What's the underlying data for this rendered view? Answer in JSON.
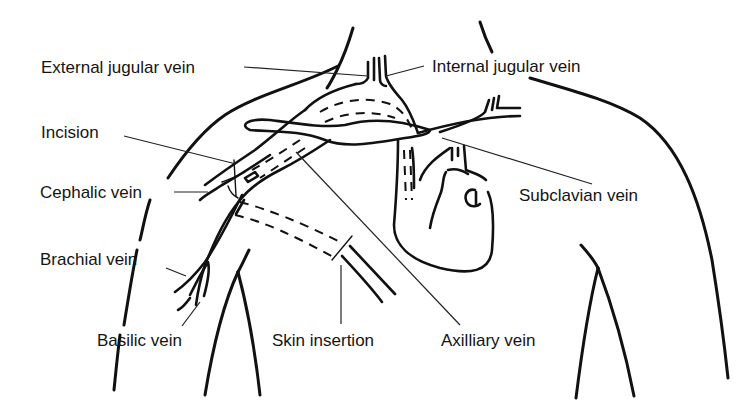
{
  "diagram": {
    "type": "anatomical-line-drawing",
    "labels": {
      "external_jugular": "External jugular vein",
      "internal_jugular": "Internal jugular vein",
      "incision": "Incision",
      "cephalic": "Cephalic vein",
      "subclavian": "Subclavian vein",
      "brachial": "Brachial vein",
      "basilic": "Basilic vein",
      "skin_insertion": "Skin insertion",
      "axillary": "Axilliary vein"
    },
    "colors": {
      "line": "#111111",
      "background": "#ffffff"
    }
  }
}
